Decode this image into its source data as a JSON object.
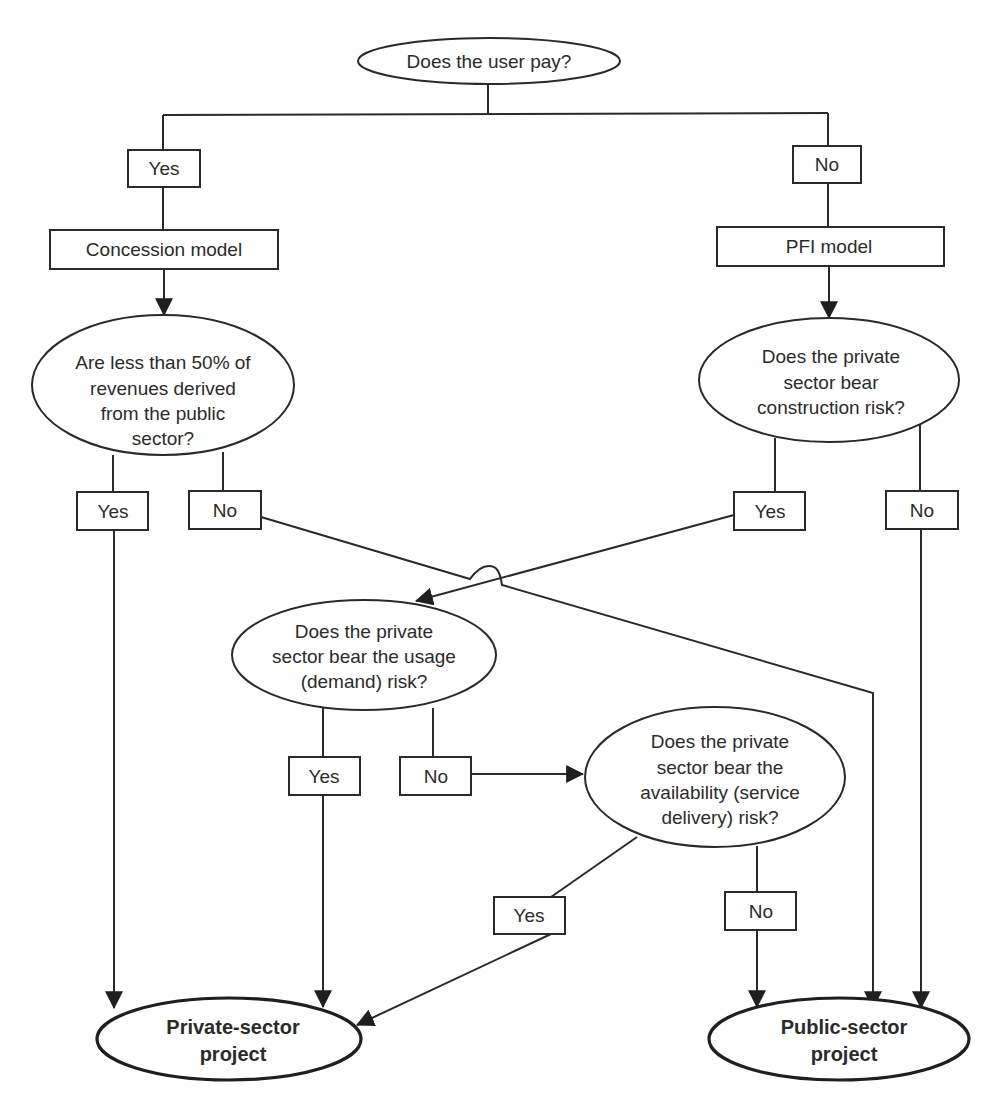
{
  "diagram": {
    "nodes": {
      "user_pays": {
        "type": "decision",
        "lines": [
          "Does the user pay?"
        ]
      },
      "yes_user_pays": {
        "type": "label",
        "text": "Yes"
      },
      "no_user_pays": {
        "type": "label",
        "text": "No"
      },
      "concession_model": {
        "type": "process",
        "text": "Concession model"
      },
      "pfi_model": {
        "type": "process",
        "text": "PFI model"
      },
      "less_than_50": {
        "type": "decision",
        "lines": [
          "Are less than 50% of",
          "revenues derived",
          "from the public",
          "sector?"
        ]
      },
      "yes_less_than_50": {
        "type": "label",
        "text": "Yes"
      },
      "no_less_than_50": {
        "type": "label",
        "text": "No"
      },
      "construction_risk": {
        "type": "decision",
        "lines": [
          "Does the private",
          "sector bear",
          "construction risk?"
        ]
      },
      "yes_construction": {
        "type": "label",
        "text": "Yes"
      },
      "no_construction": {
        "type": "label",
        "text": "No"
      },
      "usage_risk": {
        "type": "decision",
        "lines": [
          "Does the private",
          "sector bear the usage",
          "(demand) risk?"
        ]
      },
      "yes_usage": {
        "type": "label",
        "text": "Yes"
      },
      "no_usage": {
        "type": "label",
        "text": "No"
      },
      "availability_risk": {
        "type": "decision",
        "lines": [
          "Does the private",
          "sector bear the",
          "availability (service",
          "delivery) risk?"
        ]
      },
      "yes_availability": {
        "type": "label",
        "text": "Yes"
      },
      "no_availability": {
        "type": "label",
        "text": "No"
      },
      "private_project": {
        "type": "terminal",
        "lines": [
          "Private-sector",
          "project"
        ]
      },
      "public_project": {
        "type": "terminal",
        "lines": [
          "Public-sector",
          "project"
        ]
      }
    },
    "edges": [
      {
        "from": "user_pays",
        "to": "yes_user_pays"
      },
      {
        "from": "user_pays",
        "to": "no_user_pays"
      },
      {
        "from": "yes_user_pays",
        "to": "concession_model"
      },
      {
        "from": "no_user_pays",
        "to": "pfi_model"
      },
      {
        "from": "concession_model",
        "to": "less_than_50"
      },
      {
        "from": "pfi_model",
        "to": "construction_risk"
      },
      {
        "from": "less_than_50",
        "to": "yes_less_than_50"
      },
      {
        "from": "less_than_50",
        "to": "no_less_than_50"
      },
      {
        "from": "yes_less_than_50",
        "to": "private_project"
      },
      {
        "from": "no_less_than_50",
        "to": "public_project"
      },
      {
        "from": "construction_risk",
        "to": "yes_construction"
      },
      {
        "from": "construction_risk",
        "to": "no_construction"
      },
      {
        "from": "yes_construction",
        "to": "usage_risk"
      },
      {
        "from": "no_construction",
        "to": "public_project"
      },
      {
        "from": "usage_risk",
        "to": "yes_usage"
      },
      {
        "from": "usage_risk",
        "to": "no_usage"
      },
      {
        "from": "yes_usage",
        "to": "private_project"
      },
      {
        "from": "no_usage",
        "to": "availability_risk"
      },
      {
        "from": "availability_risk",
        "to": "yes_availability"
      },
      {
        "from": "availability_risk",
        "to": "no_availability"
      },
      {
        "from": "yes_availability",
        "to": "private_project"
      },
      {
        "from": "no_availability",
        "to": "public_project"
      }
    ],
    "colors": {
      "stroke": "#2a2a2a",
      "text": "#2b2b2b",
      "background": "#ffffff"
    }
  }
}
